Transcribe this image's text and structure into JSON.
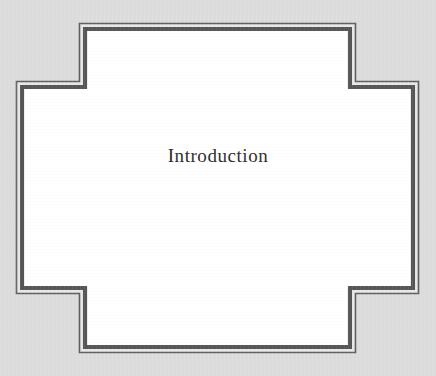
{
  "page": {
    "kind": "book-chapter-divider-page",
    "width": 436,
    "height": 376,
    "background_color": "#dcdcdc",
    "panel_fill_color": "#ffffff",
    "border_color": "#5f5f5f",
    "border_inner_color": "#565656",
    "border_gap_color": "#e8e8e8",
    "title": "Introduction",
    "title_color": "#2b2b2b"
  },
  "frame": {
    "shape_name": "cross-shaped-panel",
    "horizontal_bar": {
      "x1": 22,
      "y1": 87,
      "x2": 413,
      "y2": 288
    },
    "vertical_bar": {
      "x1": 85,
      "y1": 29,
      "x2": 350,
      "y2": 347
    },
    "outline_outer_width": 1.6,
    "outline_inner_width": 4.2,
    "outline_gap": 2.6
  },
  "content": {
    "heading": "Introduction"
  }
}
